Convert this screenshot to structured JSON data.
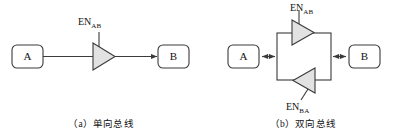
{
  "figure": {
    "panels": [
      {
        "id": "a",
        "caption": "（a）单向总线",
        "nodes": [
          {
            "name": "source",
            "label": "A"
          },
          {
            "name": "destination",
            "label": "B"
          }
        ],
        "buffers": [
          {
            "name": "buffer-ab",
            "enable_prefix": "EN",
            "enable_subscript": "AB",
            "direction": "right",
            "fill": "#e2e2e2"
          }
        ],
        "arrows": [
          {
            "name": "arrow-a-to-b",
            "style": "single",
            "direction": "right"
          }
        ]
      },
      {
        "id": "b",
        "caption": "（b）双向总线",
        "nodes": [
          {
            "name": "endpoint-a",
            "label": "A"
          },
          {
            "name": "endpoint-b",
            "label": "B"
          }
        ],
        "buffers": [
          {
            "name": "buffer-ab",
            "enable_prefix": "EN",
            "enable_subscript": "AB",
            "direction": "right",
            "fill": "#e2e2e2"
          },
          {
            "name": "buffer-ba",
            "enable_prefix": "EN",
            "enable_subscript": "BA",
            "direction": "left",
            "fill": "#e2e2e2"
          }
        ],
        "arrows": [
          {
            "name": "arrow-a-bus",
            "style": "double",
            "direction": "both"
          },
          {
            "name": "arrow-bus-b",
            "style": "double",
            "direction": "both"
          }
        ]
      }
    ],
    "colors": {
      "line": "#3a3a3a",
      "buffer_fill": "#e2e2e2",
      "text": "#111111",
      "background": "#ffffff"
    }
  }
}
